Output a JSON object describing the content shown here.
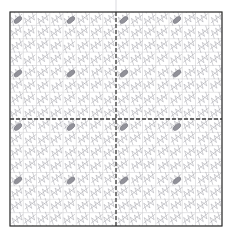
{
  "figure": {
    "title": "",
    "background_color": "#ffffff",
    "width": 233,
    "height": 231
  },
  "plot_area": {
    "x": 10,
    "y": 12,
    "width": 212,
    "height": 214,
    "border_color": "#2b2b2b",
    "border_width": 1.2,
    "fill_color": "#ffffff"
  },
  "grid": {
    "visible": true,
    "color": "#c8c8cc",
    "line_width": 0.5,
    "columns": 16,
    "rows": 16
  },
  "axes_lines": {
    "visible": true,
    "style": "dashed",
    "color": "#3a3a3a",
    "line_width": 1.3,
    "dash_pattern": "4 2",
    "x_zero": 0,
    "y_zero": 0
  },
  "overhang_line": {
    "visible": true,
    "color": "#d9d9de",
    "line_width": 1.0,
    "x": 116,
    "y_top": 0,
    "y_bottom": 12
  },
  "chart_data": {
    "type": "scatter",
    "title": "",
    "subtitle": "",
    "xlabel": "",
    "ylabel": "",
    "xlim": [
      -8,
      8
    ],
    "ylim": [
      -8,
      8
    ],
    "grid": true,
    "legend": null,
    "xticklabels": [],
    "yticklabels": [],
    "annotations": [],
    "series": [
      {
        "name": "hatch-texture",
        "marker": "diagonal-stroke",
        "color": "#9a9aa2",
        "line_width": 0.55,
        "opacity": 0.85,
        "description": "dense repeating diagonal scribble strokes tiled across the full axes",
        "tile_size": 13.3,
        "stroke_angle_deg": -38,
        "count": 256
      },
      {
        "name": "highlight-markers",
        "marker": "ellipse",
        "color": "#8d8d95",
        "edge_color": "#6e6e77",
        "opacity": 0.95,
        "width": 9,
        "height": 4.5,
        "angle_deg": -38,
        "description": "darker elongated ellipse markers placed on a regular lattice every 4th grid cell",
        "spacing_cells": 4,
        "count": 36,
        "points": [
          {
            "x": -6.5,
            "y": 6.5
          },
          {
            "x": -4.5,
            "y": 6.5
          },
          {
            "x": -2.5,
            "y": 6.5
          },
          {
            "x": -0.5,
            "y": 6.5
          },
          {
            "x": 1.5,
            "y": 6.5
          },
          {
            "x": 3.5,
            "y": 6.5
          },
          {
            "x": 5.5,
            "y": 6.5
          },
          {
            "x": -6.5,
            "y": 3.5
          },
          {
            "x": -4.5,
            "y": 3.5
          },
          {
            "x": -2.5,
            "y": 3.5
          },
          {
            "x": -0.5,
            "y": 3.5
          },
          {
            "x": 1.5,
            "y": 3.5
          },
          {
            "x": 3.5,
            "y": 3.5
          },
          {
            "x": 5.5,
            "y": 3.5
          },
          {
            "x": -6.5,
            "y": 0.5
          },
          {
            "x": -4.5,
            "y": 0.5
          },
          {
            "x": -2.5,
            "y": 0.5
          },
          {
            "x": -0.5,
            "y": 0.5
          },
          {
            "x": 1.5,
            "y": 0.5
          },
          {
            "x": 3.5,
            "y": 0.5
          },
          {
            "x": 5.5,
            "y": 0.5
          },
          {
            "x": -6.5,
            "y": -2.5
          },
          {
            "x": -4.5,
            "y": -2.5
          },
          {
            "x": -2.5,
            "y": -2.5
          },
          {
            "x": -0.5,
            "y": -2.5
          },
          {
            "x": 1.5,
            "y": -2.5
          },
          {
            "x": 3.5,
            "y": -2.5
          },
          {
            "x": 5.5,
            "y": -2.5
          },
          {
            "x": -6.5,
            "y": -5.5
          },
          {
            "x": -4.5,
            "y": -5.5
          },
          {
            "x": -2.5,
            "y": -5.5
          },
          {
            "x": -0.5,
            "y": -5.5
          },
          {
            "x": 1.5,
            "y": -5.5
          },
          {
            "x": 3.5,
            "y": -5.5
          },
          {
            "x": 5.5,
            "y": -5.5
          },
          {
            "x": -6.5,
            "y": -7.5
          }
        ]
      }
    ]
  }
}
